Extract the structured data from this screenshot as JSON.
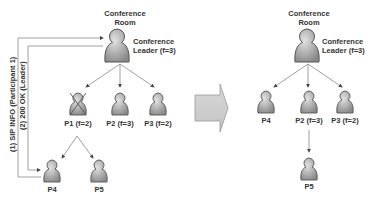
{
  "before": {
    "room_label_line1": "Conference",
    "room_label_line2": "Room",
    "leader_label_line1": "Conference",
    "leader_label_line2": "Leader (f=3)",
    "participants": [
      {
        "id": "P1",
        "label": "P1 (f=2)",
        "status": "removed"
      },
      {
        "id": "P2",
        "label": "P2 (f=3)",
        "status": "active"
      },
      {
        "id": "P3",
        "label": "P3 (f=2)",
        "status": "active"
      },
      {
        "id": "P4",
        "label": "P4",
        "status": "active"
      },
      {
        "id": "P5",
        "label": "P5",
        "status": "active"
      }
    ],
    "messages": [
      {
        "label": "(1) SIP INFO (Participant 1)"
      },
      {
        "label": "(2) 200 OK (Leader)"
      }
    ]
  },
  "after": {
    "room_label_line1": "Conference",
    "room_label_line2": "Room",
    "leader_label_line1": "Conference",
    "leader_label_line2": "Leader (f=3)",
    "participants": [
      {
        "id": "P4",
        "label": "P4"
      },
      {
        "id": "P2",
        "label": "P2 (f=3)"
      },
      {
        "id": "P3",
        "label": "P3 (f=2)"
      },
      {
        "id": "P5",
        "label": "P5"
      }
    ]
  },
  "colors": {
    "icon_fill": "#a8a8a8",
    "icon_stroke": "#555555",
    "line": "#888888",
    "transition_arrow": "#cfcfcf"
  }
}
